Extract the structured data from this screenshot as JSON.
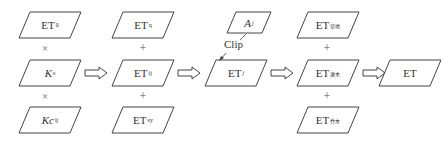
{
  "diagram": {
    "type": "flow",
    "stroke_color": "#444444",
    "columns": [
      {
        "id": "col1",
        "items": [
          {
            "base": "ET",
            "sub": "0",
            "italic": false
          },
          {
            "base": "K",
            "sub": "s",
            "italic": true
          },
          {
            "base": "Kc",
            "sub": "ij",
            "italic": true
          }
        ],
        "operators": [
          "×",
          "×"
        ]
      },
      {
        "id": "col2",
        "items": [
          {
            "base": "ET",
            "sub": "q",
            "italic": false
          },
          {
            "base": "ET",
            "sub": "ij",
            "italic": false
          },
          {
            "base": "ET",
            "sub": "sy",
            "italic": false
          }
        ],
        "operators": [
          "+",
          "+"
        ]
      },
      {
        "id": "col3",
        "mask": {
          "base": "A",
          "sub": "j",
          "italic": true
        },
        "clip_label": "Clip",
        "item": {
          "base": "ET",
          "sub": "j",
          "italic": false
        }
      },
      {
        "id": "col4",
        "items": [
          {
            "base": "ET",
            "sub": "草地",
            "italic": false
          },
          {
            "base": "ET",
            "sub": "灌木",
            "italic": false
          },
          {
            "base": "ET",
            "sub": "乔木",
            "italic": false
          }
        ],
        "operators": [
          "+",
          "+"
        ]
      },
      {
        "id": "col5",
        "item": {
          "base": "ET",
          "sub": "",
          "italic": false
        }
      }
    ],
    "arrows": [
      "⇨",
      "⇨",
      "⇨",
      "⇨"
    ]
  }
}
